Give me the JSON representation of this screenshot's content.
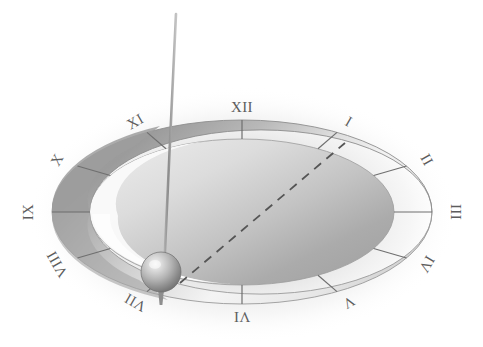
{
  "figure": {
    "title": "Sundial dial with gnomon and shadow line",
    "background_color": "#ffffff",
    "glow_color": "#e8e8e8",
    "ring_dark_color": "#9a9a9a",
    "ring_light_color": "#f2f2f2",
    "disc_light_color": "#d9d9d9",
    "disc_dark_color": "#a9a9a9",
    "numeral_color": "#5d5d5d",
    "tick_color": "#6f6f6f",
    "rod_color": "#8f8f8f",
    "dashed_line_color": "#555555",
    "sphere_highlight_color": "#efefef",
    "sphere_shadow_color": "#7a7a7a"
  },
  "dial": {
    "center_x": 242,
    "center_y": 212,
    "outer_radius_x": 190,
    "outer_radius_y": 92,
    "inner_radius_x": 152,
    "inner_radius_y": 73,
    "numeral_radius_x": 212,
    "numeral_radius_y": 103,
    "hours": [
      {
        "label": "XII",
        "hour": 12,
        "angle_deg": 270,
        "rotation_deg": 0
      },
      {
        "label": "I",
        "hour": 1,
        "angle_deg": 300,
        "rotation_deg": 30
      },
      {
        "label": "II",
        "hour": 2,
        "angle_deg": 330,
        "rotation_deg": 60
      },
      {
        "label": "III",
        "hour": 3,
        "angle_deg": 0,
        "rotation_deg": 90
      },
      {
        "label": "IV",
        "hour": 4,
        "angle_deg": 30,
        "rotation_deg": 120
      },
      {
        "label": "V",
        "hour": 5,
        "angle_deg": 60,
        "rotation_deg": 150
      },
      {
        "label": "VI",
        "hour": 6,
        "angle_deg": 90,
        "rotation_deg": 180
      },
      {
        "label": "VII",
        "hour": 7,
        "angle_deg": 120,
        "rotation_deg": 210
      },
      {
        "label": "VIII",
        "hour": 8,
        "angle_deg": 150,
        "rotation_deg": 240
      },
      {
        "label": "IX",
        "hour": 9,
        "angle_deg": 180,
        "rotation_deg": 270
      },
      {
        "label": "X",
        "hour": 10,
        "angle_deg": 210,
        "rotation_deg": 300
      },
      {
        "label": "XI",
        "hour": 11,
        "angle_deg": 240,
        "rotation_deg": 330
      }
    ]
  },
  "gnomon": {
    "top_x": 176,
    "top_y": 14,
    "base_x": 163,
    "base_y": 292,
    "width": 2.6
  },
  "bob": {
    "center_x": 161,
    "center_y": 272,
    "radius": 20
  },
  "shadow_line": {
    "from_x": 180,
    "from_y": 283,
    "to_x": 345,
    "to_y": 143,
    "dash_pattern": "9 7",
    "width": 1.8
  }
}
